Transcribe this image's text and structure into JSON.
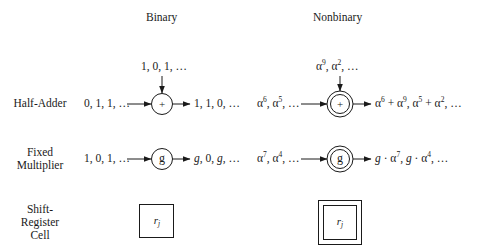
{
  "headers": {
    "binary": "Binary",
    "nonbinary": "Nonbinary"
  },
  "rows": [
    {
      "label_lines": [
        "Half-Adder"
      ]
    },
    {
      "label_lines": [
        "Fixed",
        "Multiplier"
      ]
    },
    {
      "label_lines": [
        "Shift-",
        "Register",
        "Cell"
      ]
    }
  ],
  "binary": {
    "half_adder": {
      "top_input": "1, 0, 1, …",
      "left_input": "0, 1, 1, …",
      "symbol": "+",
      "output": "1, 1, 0, …"
    },
    "fixed_multiplier": {
      "input": "1, 0, 1, …",
      "symbol": "g",
      "output_parts": [
        "g",
        ", 0, ",
        "g",
        ", …"
      ]
    },
    "shift_register": {
      "symbol_base": "r",
      "symbol_sub": "j"
    }
  },
  "nonbinary": {
    "half_adder": {
      "top_input": {
        "base": "α",
        "terms": [
          {
            "exp": "9"
          },
          {
            "exp": "2"
          }
        ],
        "tail": ", …"
      },
      "left_input": {
        "base": "α",
        "terms": [
          {
            "exp": "6"
          },
          {
            "exp": "5"
          }
        ],
        "tail": ", …"
      },
      "symbol": "+",
      "output": "α^6 + α^9, α^5 + α^2, …"
    },
    "fixed_multiplier": {
      "input": {
        "base": "α",
        "terms": [
          {
            "exp": "7"
          },
          {
            "exp": "4"
          }
        ],
        "tail": ", …"
      },
      "symbol": "g",
      "output": "g · α^7, g · α^4, …"
    },
    "shift_register": {
      "symbol_base": "r",
      "symbol_sub": "j"
    }
  },
  "labels": {
    "alpha": "α",
    "e9": "9",
    "e2": "2",
    "e6": "6",
    "e5": "5",
    "e7": "7",
    "e4": "4",
    "comma": ", ",
    "ellipsis_tail": ", …",
    "plus": " + ",
    "dot": " · ",
    "g": "g"
  }
}
